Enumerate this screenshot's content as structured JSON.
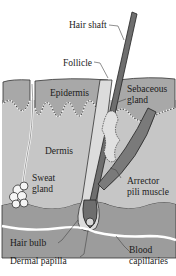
{
  "diagram": {
    "type": "anatomical-cross-section",
    "colors": {
      "epidermis": "#a9a9a9",
      "dermis": "#c4c4c4",
      "hypodermis": "#9a9a9a",
      "hair": "#6e6e6e",
      "outline": "#2a2a2a",
      "background": "#ffffff"
    },
    "labels": {
      "hair_shaft": "Hair shaft",
      "follicle": "Follicle",
      "epidermis": "Epidermis",
      "sebaceous_gland_1": "Sebaceous",
      "sebaceous_gland_2": "gland",
      "dermis": "Dermis",
      "sweat_gland_1": "Sweat",
      "sweat_gland_2": "gland",
      "arrector_1": "Arrector",
      "arrector_2": "pili muscle",
      "hair_bulb": "Hair bulb",
      "dermal_papilla": "Dermal papilla",
      "blood_capillaries_1": "Blood",
      "blood_capillaries_2": "capillaries"
    }
  }
}
